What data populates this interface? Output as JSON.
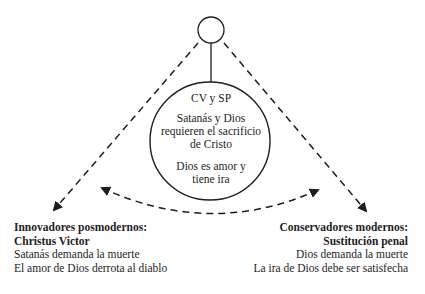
{
  "diagram": {
    "type": "triangle-relationship",
    "colors": {
      "stroke": "#1e1e1e",
      "text": "#1e1e1e",
      "background": "#ffffff"
    },
    "top_node": {
      "shape": "small-circle",
      "label": ""
    },
    "center_node": {
      "shape": "circle",
      "heading": "CV y SP",
      "block1": [
        "Satanás y Dios",
        "requieren el sacrificio",
        "de Cristo"
      ],
      "block2": [
        "Dios es amor y",
        "tiene ira"
      ]
    },
    "left_node": {
      "title_lines": [
        "Innovadores posmodernos:",
        "Christus Victor"
      ],
      "body_lines": [
        "Satanás demanda la muerte",
        "El amor de Dios derrota al diablo"
      ]
    },
    "right_node": {
      "title_lines": [
        "Conservadores modernos:",
        "Sustitución penal"
      ],
      "body_lines": [
        "Dios demanda la muerte",
        "La ira de Dios debe ser satisfecha"
      ]
    },
    "edges": [
      {
        "from": "top_node",
        "to": "center_node",
        "style": "solid"
      },
      {
        "from": "top_node",
        "to": "left_node",
        "style": "dashed",
        "arrow": "end"
      },
      {
        "from": "top_node",
        "to": "right_node",
        "style": "dashed",
        "arrow": "end"
      },
      {
        "from": "left_node",
        "to": "right_node",
        "style": "dashed-curve",
        "arrow": "both"
      }
    ]
  }
}
